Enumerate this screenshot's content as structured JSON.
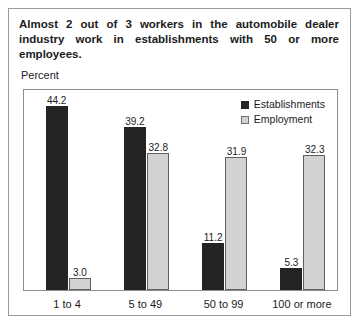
{
  "figure": {
    "title": "Almost 2 out of 3 workers in the automobile dealer industry work in establishments with 50 or more employees.",
    "axis_caption": "Percent"
  },
  "legend": {
    "position": "top-right",
    "entries": [
      {
        "label": "Establishments",
        "color": "#242424",
        "swatch": "dark"
      },
      {
        "label": "Employment",
        "color": "#d2d2d2",
        "swatch": "light"
      }
    ]
  },
  "chart_data": {
    "type": "bar",
    "title": "Almost 2 out of 3 workers in the automobile dealer industry work in establishments with 50 or more employees.",
    "xlabel": "",
    "ylabel": "Percent",
    "ylim": [
      0,
      48
    ],
    "grid": false,
    "legend_position": "top-right",
    "categories": [
      "1 to 4",
      "5 to 49",
      "50 to 99",
      "100 or more"
    ],
    "series": [
      {
        "name": "Establishments",
        "color": "#242424",
        "values": [
          44.2,
          39.2,
          11.2,
          5.3
        ],
        "labels": [
          "44.2",
          "39.2",
          "11.2",
          "5.3"
        ]
      },
      {
        "name": "Employment",
        "color": "#d2d2d2",
        "values": [
          3.0,
          32.8,
          31.9,
          32.3
        ],
        "labels": [
          "3.0",
          "32.8",
          "31.9",
          "32.3"
        ]
      }
    ]
  }
}
